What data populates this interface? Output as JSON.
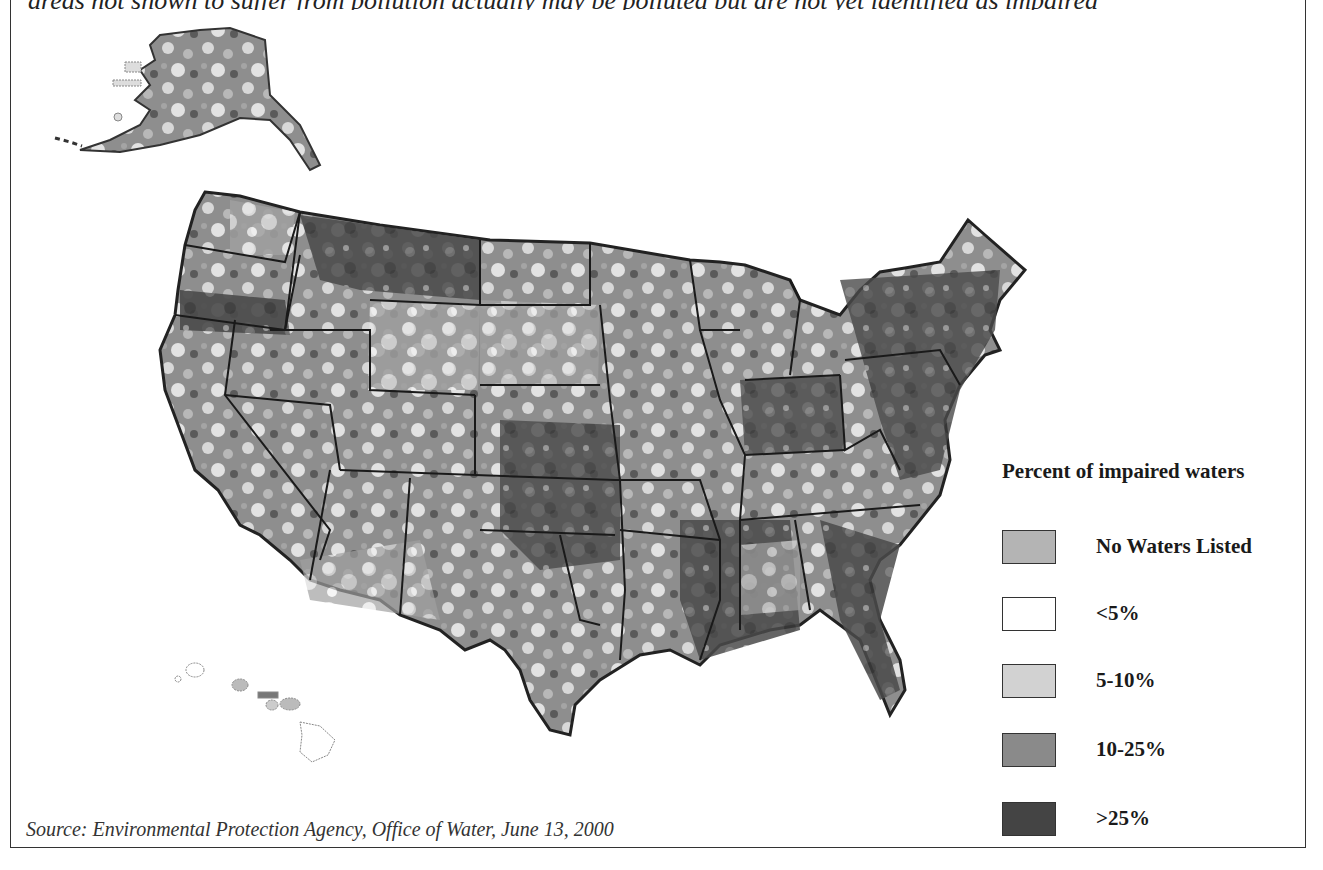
{
  "header": {
    "cut_off_text": "areas not shown to suffer from pollution actually may be polluted but are not yet identified as impaired"
  },
  "map": {
    "regions": [
      "Alaska",
      "Hawaii",
      "Contiguous United States"
    ],
    "state_outline_color": "#1a1a1a"
  },
  "legend": {
    "title": "Percent of impaired waters",
    "items": [
      {
        "label": "No Waters Listed",
        "color": "#b4b4b4"
      },
      {
        "label": "<5%",
        "color": "#ffffff"
      },
      {
        "label": "5-10%",
        "color": "#d2d2d2"
      },
      {
        "label": "10-25%",
        "color": "#8a8a8a"
      },
      {
        "label": ">25%",
        "color": "#444444"
      }
    ]
  },
  "source": {
    "text": "Source: Environmental Protection Agency, Office of Water, June 13, 2000"
  }
}
